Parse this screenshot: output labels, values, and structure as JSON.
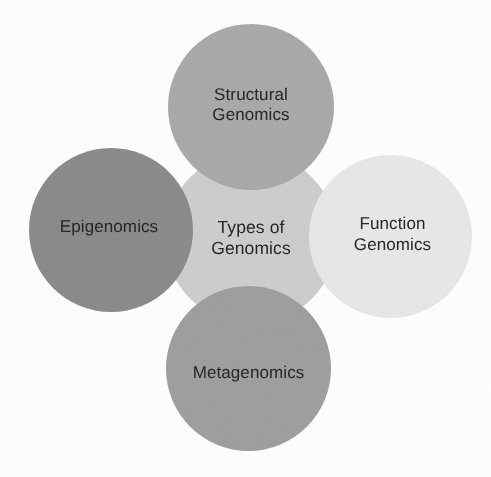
{
  "diagram": {
    "type": "bubble-cluster",
    "background_color": "#ffffff",
    "text_color": "#262626",
    "hub": {
      "id": "types-of-genomics",
      "label": "Types of\nGenomics",
      "color": "#cfcfcf"
    },
    "nodes": [
      {
        "id": "structural-genomics",
        "label": "Structural\nGenomics",
        "color": "#ababab",
        "position": "top"
      },
      {
        "id": "epigenomics",
        "label": "Epigenomics",
        "color": "#8c8c8c",
        "position": "left"
      },
      {
        "id": "function-genomics",
        "label": "Function\nGenomics",
        "color": "#e9e9e9",
        "position": "right"
      },
      {
        "id": "metagenomics",
        "label": "Metagenomics",
        "color": "#a0a0a0",
        "position": "bottom"
      }
    ]
  }
}
